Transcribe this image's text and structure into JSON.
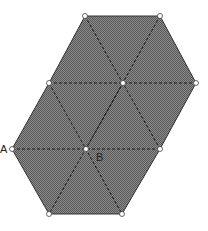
{
  "diagram": {
    "type": "triangular-lattice-figure",
    "fill_color": "#7a7a7a",
    "stroke_color": "#222222",
    "outline": [
      [
        85,
        16
      ],
      [
        160,
        16
      ],
      [
        196,
        83
      ],
      [
        160,
        149
      ],
      [
        122,
        214
      ],
      [
        49,
        214
      ],
      [
        12,
        149
      ],
      [
        49,
        83
      ]
    ],
    "vertices": [
      {
        "x": 85,
        "y": 16
      },
      {
        "x": 160,
        "y": 16
      },
      {
        "x": 49,
        "y": 83
      },
      {
        "x": 123,
        "y": 83
      },
      {
        "x": 196,
        "y": 83
      },
      {
        "x": 12,
        "y": 149
      },
      {
        "x": 86,
        "y": 149
      },
      {
        "x": 160,
        "y": 149
      },
      {
        "x": 49,
        "y": 214
      },
      {
        "x": 122,
        "y": 214
      }
    ],
    "dashed_lines": [
      [
        [
          49,
          83
        ],
        [
          196,
          83
        ]
      ],
      [
        [
          12,
          149
        ],
        [
          160,
          149
        ]
      ],
      [
        [
          85,
          16
        ],
        [
          160,
          149
        ]
      ],
      [
        [
          160,
          16
        ],
        [
          86,
          149
        ]
      ],
      [
        [
          123,
          83
        ],
        [
          49,
          214
        ]
      ],
      [
        [
          49,
          83
        ],
        [
          122,
          214
        ]
      ],
      [
        [
          196,
          83
        ],
        [
          160,
          149
        ]
      ]
    ],
    "labels": [
      {
        "id": "A",
        "text": "A",
        "x": 0,
        "y": 153
      },
      {
        "id": "B",
        "text": "B",
        "x": 97,
        "y": 160
      }
    ]
  }
}
